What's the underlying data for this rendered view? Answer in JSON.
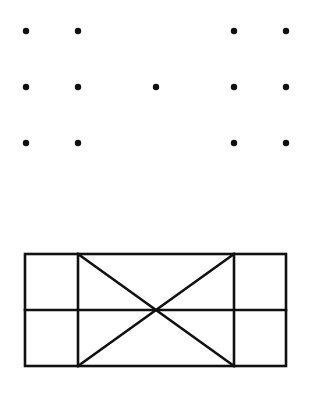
{
  "diagram": {
    "background": "#ffffff",
    "stroke_color": "#111111",
    "dot_color": "#111111",
    "dot_radius": 3.2,
    "stroke_width": 2.6,
    "dots": [
      {
        "x": 26,
        "y": 31
      },
      {
        "x": 78,
        "y": 31
      },
      {
        "x": 234,
        "y": 31
      },
      {
        "x": 286,
        "y": 31
      },
      {
        "x": 26,
        "y": 87
      },
      {
        "x": 78,
        "y": 87
      },
      {
        "x": 156,
        "y": 87
      },
      {
        "x": 234,
        "y": 87
      },
      {
        "x": 286,
        "y": 87
      },
      {
        "x": 26,
        "y": 143
      },
      {
        "x": 78,
        "y": 143
      },
      {
        "x": 234,
        "y": 143
      },
      {
        "x": 286,
        "y": 143
      }
    ],
    "figure": {
      "outer_rect": {
        "x": 25,
        "y": 254,
        "width": 261,
        "height": 112
      },
      "lines": [
        {
          "x1": 25,
          "y1": 310,
          "x2": 286,
          "y2": 310
        },
        {
          "x1": 78,
          "y1": 254,
          "x2": 78,
          "y2": 366
        },
        {
          "x1": 234,
          "y1": 254,
          "x2": 234,
          "y2": 366
        },
        {
          "x1": 78,
          "y1": 254,
          "x2": 234,
          "y2": 366
        },
        {
          "x1": 234,
          "y1": 254,
          "x2": 78,
          "y2": 366
        }
      ]
    }
  }
}
